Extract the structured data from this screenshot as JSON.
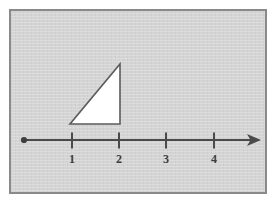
{
  "figure": {
    "panel": {
      "background_color": "#d4d4d4",
      "border_color": "#8a8a8a",
      "outer_background_color": "#ffffff"
    },
    "number_line": {
      "label": "number-line",
      "line_color": "#4a4a4a",
      "origin_dot": {
        "label": "origin-dot",
        "cx": 13,
        "cy": 129,
        "r": 3
      },
      "start_x": 13,
      "end_x": 250,
      "y": 129,
      "arrow": {
        "label": "arrowhead-right",
        "tip_x": 250
      },
      "ticks": [
        {
          "label": "1",
          "x": 61
        },
        {
          "label": "2",
          "x": 108
        },
        {
          "label": "3",
          "x": 155
        },
        {
          "label": "4",
          "x": 203
        }
      ],
      "tick_top_y": 122,
      "tick_bottom_y": 137,
      "tick_label_y": 151
    },
    "triangle": {
      "label": "right-triangle",
      "fill_color": "#ffffff",
      "stroke_color": "#5a5a5a",
      "vertices": [
        {
          "name": "bottom-left",
          "x": 59,
          "y": 113
        },
        {
          "name": "bottom-right",
          "x": 109,
          "y": 113
        },
        {
          "name": "top-right",
          "x": 109,
          "y": 53
        }
      ],
      "base_from": 1,
      "base_to": 2,
      "right_angle_at": "bottom-right"
    }
  }
}
